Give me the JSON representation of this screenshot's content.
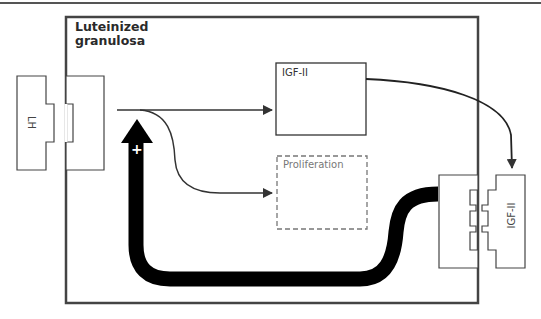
{
  "figure": {
    "cell": {
      "title_line1": "Luteinized",
      "title_line2": "granulosa"
    },
    "ligands": {
      "left": "LH",
      "right": "IGF-II"
    },
    "boxes": {
      "igf": "IGF-II",
      "proliferation": "Proliferation"
    },
    "feedback": {
      "sign": "+"
    },
    "colors": {
      "line": "#333333",
      "feedback_arrow": "#000000",
      "dashed_box": "#777777",
      "background": "#ffffff"
    }
  }
}
